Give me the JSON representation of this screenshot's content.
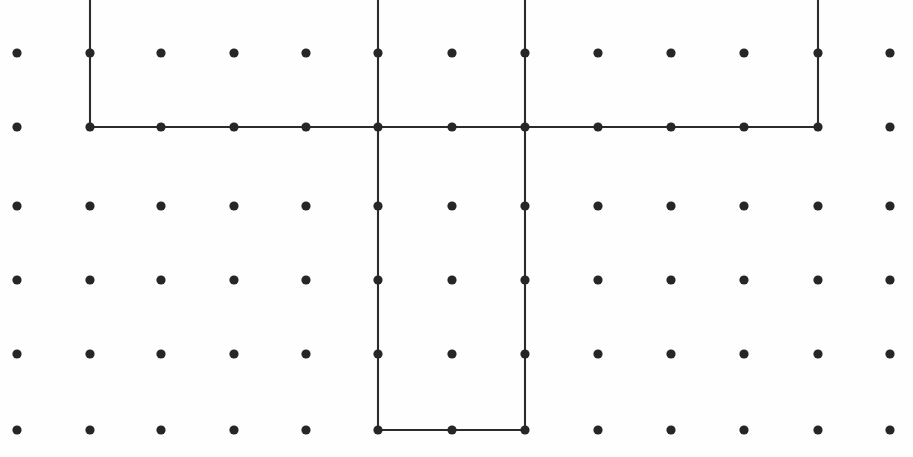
{
  "figure": {
    "canvas": {
      "width": 913,
      "height": 457
    },
    "background_color": "#fefefe",
    "dot_color": "#262626",
    "line_color": "#2b2b2b",
    "dot_radius": 4.6,
    "line_width": 2.1
  },
  "chart_data": {
    "type": "scatter",
    "title": "",
    "subtitle": "",
    "xlabel": "",
    "ylabel": "",
    "grid": true,
    "legend": null,
    "xlim": [
      0,
      913
    ],
    "ylim": [
      0,
      457
    ],
    "grid_columns_x": [
      17,
      90,
      161,
      234,
      306,
      378,
      452,
      525,
      598,
      671,
      744,
      818,
      890
    ],
    "grid_rows_y": [
      53,
      127,
      206,
      280,
      354,
      430
    ],
    "n_columns": 13,
    "n_rows": 6,
    "n_points": 78,
    "column_spacing": 73,
    "row_spacing": 74,
    "annotations": [
      {
        "name": "upper-bracket-polyline",
        "shape": "open-rectangle-down",
        "points": [
          [
            90,
            0
          ],
          [
            90,
            127
          ],
          [
            818,
            127
          ],
          [
            818,
            0
          ]
        ]
      },
      {
        "name": "lower-bracket-polyline",
        "shape": "open-rectangle-up",
        "points": [
          [
            378,
            0
          ],
          [
            378,
            430
          ],
          [
            525,
            430
          ],
          [
            525,
            0
          ]
        ]
      }
    ]
  }
}
